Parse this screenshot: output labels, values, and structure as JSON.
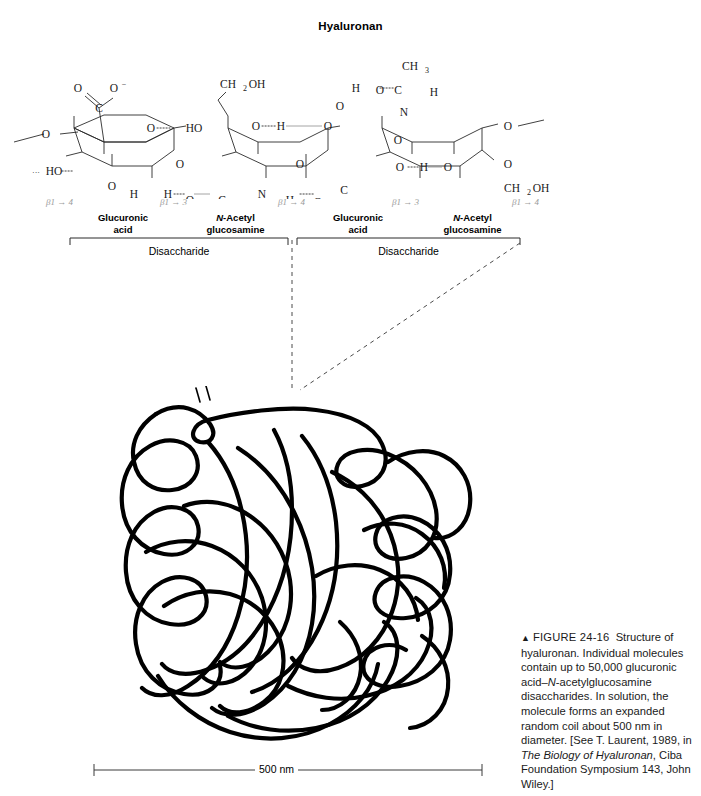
{
  "figure": {
    "title": "Hyaluronan",
    "caption": {
      "marker": "▲",
      "figure_number": "FIGURE 24-16",
      "text_parts": [
        "Structure of hyaluronan. Individual molecules contain up to 50,000 glucuronic acid–",
        "N",
        "-acetylglucosamine disaccharides. In solution, the molecule forms an expanded random coil about 500 nm in diameter. [See T. Laurent, 1989, in ",
        "The Biology of Hyaluronan",
        ", Ciba Foundation Symposium 143, John Wiley.]"
      ]
    },
    "scale_bar": {
      "label": "500 nm"
    }
  },
  "linkages": [
    {
      "label": "β1 → 4",
      "x": 52
    },
    {
      "label": "β1 → 3",
      "x": 165
    },
    {
      "label": "β1 → 4",
      "x": 283
    },
    {
      "label": "β1 → 3",
      "x": 397
    },
    {
      "label": "β1 → 4",
      "x": 515
    }
  ],
  "sugars": [
    {
      "line1": "Glucuronic",
      "line2": "acid",
      "italic_prefix": "",
      "x": 78,
      "w": 90
    },
    {
      "line1": "-Acetyl",
      "line2": "glucosamine",
      "italic_prefix": "N",
      "x": 188,
      "w": 100
    },
    {
      "line1": "Glucuronic",
      "line2": "acid",
      "italic_prefix": "",
      "x": 315,
      "w": 90
    },
    {
      "line1": "-Acetyl",
      "line2": "glucosamine",
      "italic_prefix": "N",
      "x": 425,
      "w": 100
    }
  ],
  "disaccharide_labels": [
    {
      "label": "Disaccharide",
      "x": 70,
      "w": 225
    },
    {
      "label": "Disaccharide",
      "x": 303,
      "w": 230
    }
  ],
  "structure_atoms": {
    "carboxylate_top": {
      "o_double": "O",
      "c": "C",
      "o_minus": "O⁻"
    },
    "hydroxymethyl": {
      "label": "CH",
      "sub": "2",
      "tail": "OH"
    },
    "acetyl_methyl": {
      "label": "CH",
      "sub": "3"
    },
    "ring_oxygen": "O",
    "hydroxyl": "HO",
    "amide_nitrogen": "N",
    "hydrogen": "H"
  },
  "colors": {
    "ink": "#000000",
    "bond": "#2b2b2b",
    "linkage_gray": "#9a9a9a",
    "leader_gray": "#4a4a4a",
    "background": "#ffffff"
  }
}
